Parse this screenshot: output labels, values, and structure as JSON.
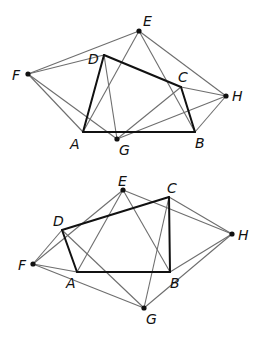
{
  "figures": [
    {
      "name": "top-figure",
      "points": {
        "E": {
          "x": 139,
          "y": 31,
          "lx": 143,
          "ly": 26,
          "dot": true
        },
        "D": {
          "x": 104,
          "y": 55,
          "lx": 88,
          "ly": 64,
          "dot": false
        },
        "F": {
          "x": 28,
          "y": 74,
          "lx": 12,
          "ly": 80,
          "dot": true
        },
        "C": {
          "x": 181,
          "y": 87,
          "lx": 178,
          "ly": 82,
          "dot": false
        },
        "H": {
          "x": 226,
          "y": 96,
          "lx": 232,
          "ly": 101,
          "dot": true
        },
        "A": {
          "x": 83,
          "y": 132,
          "lx": 70,
          "ly": 149,
          "dot": false
        },
        "G": {
          "x": 117,
          "y": 139,
          "lx": 119,
          "ly": 155,
          "dot": true
        },
        "B": {
          "x": 195,
          "y": 132,
          "lx": 195,
          "ly": 148,
          "dot": false
        }
      },
      "thick_edges": [
        [
          "A",
          "B"
        ],
        [
          "B",
          "C"
        ],
        [
          "C",
          "D"
        ],
        [
          "D",
          "A"
        ]
      ],
      "thin_edges": [
        [
          "F",
          "E"
        ],
        [
          "F",
          "D"
        ],
        [
          "F",
          "A"
        ],
        [
          "F",
          "G"
        ],
        [
          "E",
          "A"
        ],
        [
          "E",
          "B"
        ],
        [
          "E",
          "H"
        ],
        [
          "D",
          "G"
        ],
        [
          "C",
          "G"
        ],
        [
          "C",
          "H"
        ],
        [
          "G",
          "H"
        ],
        [
          "H",
          "B"
        ]
      ]
    },
    {
      "name": "bottom-figure",
      "points": {
        "E": {
          "x": 123,
          "y": 190,
          "lx": 118,
          "ly": 186,
          "dot": true
        },
        "C": {
          "x": 169,
          "y": 197,
          "lx": 167,
          "ly": 193,
          "dot": false
        },
        "D": {
          "x": 62,
          "y": 230,
          "lx": 53,
          "ly": 226,
          "dot": false
        },
        "H": {
          "x": 232,
          "y": 234,
          "lx": 238,
          "ly": 240,
          "dot": true
        },
        "F": {
          "x": 33,
          "y": 264,
          "lx": 18,
          "ly": 270,
          "dot": true
        },
        "A": {
          "x": 77,
          "y": 272,
          "lx": 66,
          "ly": 288,
          "dot": false
        },
        "B": {
          "x": 170,
          "y": 272,
          "lx": 170,
          "ly": 288,
          "dot": false
        },
        "G": {
          "x": 144,
          "y": 308,
          "lx": 146,
          "ly": 324,
          "dot": true
        }
      },
      "thick_edges": [
        [
          "A",
          "B"
        ],
        [
          "B",
          "C"
        ],
        [
          "C",
          "D"
        ],
        [
          "D",
          "A"
        ]
      ],
      "thin_edges": [
        [
          "F",
          "E"
        ],
        [
          "F",
          "D"
        ],
        [
          "F",
          "A"
        ],
        [
          "F",
          "G"
        ],
        [
          "E",
          "A"
        ],
        [
          "E",
          "B"
        ],
        [
          "E",
          "H"
        ],
        [
          "D",
          "G"
        ],
        [
          "C",
          "G"
        ],
        [
          "C",
          "H"
        ],
        [
          "H",
          "B"
        ],
        [
          "H",
          "G"
        ]
      ]
    }
  ],
  "colors": {
    "thin_line": "#6e6e6e",
    "thick_line": "#111111",
    "point": "#111111"
  }
}
